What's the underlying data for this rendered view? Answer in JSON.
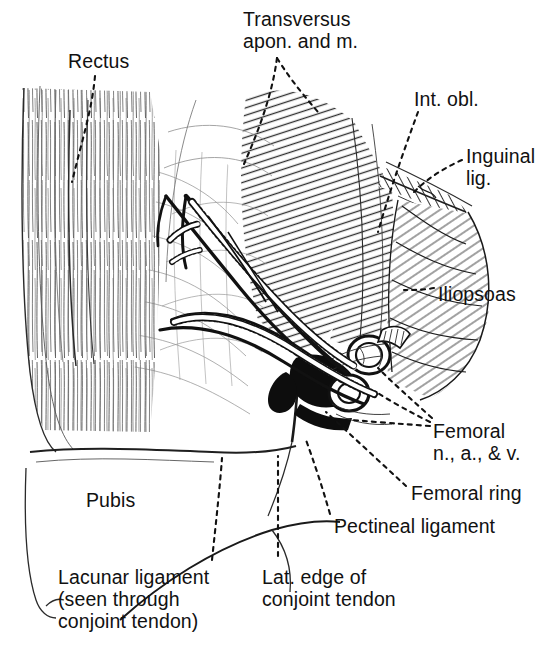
{
  "figure": {
    "type": "anatomical-line-drawing",
    "background_color": "#ffffff",
    "ink_color": "#111111",
    "width": 553,
    "height": 655
  },
  "labels": [
    {
      "id": "rectus",
      "text": "Rectus",
      "x": 68,
      "y": 50,
      "align": "left"
    },
    {
      "id": "transversus",
      "text": "Transversus\napon. and m.",
      "x": 243,
      "y": 8,
      "align": "left"
    },
    {
      "id": "int-obl",
      "text": "Int. obl.",
      "x": 414,
      "y": 88,
      "align": "left"
    },
    {
      "id": "inguinal-lig",
      "text": "Inguinal\nlig.",
      "x": 466,
      "y": 145,
      "align": "left"
    },
    {
      "id": "iliopsoas",
      "text": "Iliopsoas",
      "x": 438,
      "y": 283,
      "align": "left"
    },
    {
      "id": "femoral-nav",
      "text": "Femoral\nn., a., & v.",
      "x": 433,
      "y": 420,
      "align": "left"
    },
    {
      "id": "femoral-ring",
      "text": "Femoral ring",
      "x": 411,
      "y": 482,
      "align": "left"
    },
    {
      "id": "pectineal-lig",
      "text": "Pectineal ligament",
      "x": 334,
      "y": 515,
      "align": "left"
    },
    {
      "id": "pubis",
      "text": "Pubis",
      "x": 86,
      "y": 489,
      "align": "left"
    },
    {
      "id": "lat-edge",
      "text": "Lat. edge of\nconjoint tendon",
      "x": 262,
      "y": 566,
      "align": "left"
    },
    {
      "id": "lacunar-lig",
      "text": "Lacunar ligament\n(seen through\nconjoint tendon)",
      "x": 58,
      "y": 566,
      "align": "left"
    }
  ],
  "structures": [
    {
      "id": "rectus-muscle",
      "name": "Rectus abdominis muscle",
      "hatch": "vertical-fibers"
    },
    {
      "id": "transversus-aponeurosis",
      "name": "Transversus aponeurosis and muscle",
      "hatch": "dense-diagonal"
    },
    {
      "id": "internal-oblique",
      "name": "Internal oblique muscle",
      "hatch": "dense-diagonal"
    },
    {
      "id": "inguinal-ligament",
      "name": "Inguinal ligament",
      "hatch": "band"
    },
    {
      "id": "iliopsoas-muscle",
      "name": "Iliopsoas muscle",
      "hatch": "cross-fiber"
    },
    {
      "id": "femoral-nerve",
      "name": "Femoral nerve",
      "hatch": "stippled-cord"
    },
    {
      "id": "femoral-artery",
      "name": "Femoral artery",
      "hatch": "cut-ring"
    },
    {
      "id": "femoral-vein",
      "name": "Femoral vein",
      "hatch": "cut-ring"
    },
    {
      "id": "femoral-ring-opening",
      "name": "Femoral ring",
      "hatch": "solid-black"
    },
    {
      "id": "pectineal-ligament",
      "name": "Pectineal ligament (Cooper's)",
      "hatch": "line"
    },
    {
      "id": "lacunar-ligament",
      "name": "Lacunar ligament",
      "hatch": "outline"
    },
    {
      "id": "conjoint-tendon",
      "name": "Conjoint tendon",
      "hatch": "outline"
    },
    {
      "id": "pubis-bone",
      "name": "Pubis",
      "hatch": "blank"
    }
  ],
  "leaders": [
    {
      "id": "leader-rectus",
      "from": "rectus",
      "style": "dashed"
    },
    {
      "id": "leader-transversus-a",
      "from": "transversus",
      "style": "dashed"
    },
    {
      "id": "leader-transversus-b",
      "from": "transversus",
      "style": "dashed"
    },
    {
      "id": "leader-int-obl",
      "from": "int-obl",
      "style": "dashed"
    },
    {
      "id": "leader-inguinal",
      "from": "inguinal-lig",
      "style": "dashed"
    },
    {
      "id": "leader-iliopsoas",
      "from": "iliopsoas",
      "style": "dashed"
    },
    {
      "id": "leader-femoral-n",
      "from": "femoral-nav",
      "style": "dashed"
    },
    {
      "id": "leader-femoral-a",
      "from": "femoral-nav",
      "style": "dashed"
    },
    {
      "id": "leader-femoral-v",
      "from": "femoral-nav",
      "style": "dashed"
    },
    {
      "id": "leader-femoral-ring",
      "from": "femoral-ring",
      "style": "dashed"
    },
    {
      "id": "leader-pectineal",
      "from": "pectineal-lig",
      "style": "dashed"
    },
    {
      "id": "leader-lacunar",
      "from": "lacunar-lig",
      "style": "dashed"
    },
    {
      "id": "leader-lat-edge",
      "from": "lat-edge",
      "style": "dashed"
    }
  ]
}
